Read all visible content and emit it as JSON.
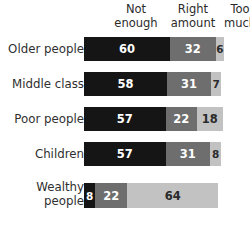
{
  "chart_data": {
    "type": "bar",
    "subtype": "horizontal-stacked-100",
    "title": "",
    "xlabel": "",
    "ylabel": "",
    "grid": false,
    "legend_position": "top",
    "categories": [
      "Older people",
      "Middle class",
      "Poor people",
      "Children",
      "Wealthy people"
    ],
    "series": [
      {
        "name": "Not enough",
        "values": [
          60,
          58,
          57,
          57,
          8
        ]
      },
      {
        "name": "Right amount",
        "values": [
          32,
          31,
          22,
          31,
          22
        ]
      },
      {
        "name": "Too much",
        "values": [
          6,
          7,
          18,
          8,
          64
        ]
      }
    ],
    "colors": {
      "not_enough": "#151515",
      "right_amount": "#6e6e6e",
      "too_much": "#c2c2c2",
      "background": "#ffffff",
      "label_text": "#2f2f2f"
    },
    "value_label_colors": [
      [
        "#ffffff",
        "#ffffff",
        "#2b2b2b"
      ],
      [
        "#ffffff",
        "#ffffff",
        "#2b2b2b"
      ],
      [
        "#ffffff",
        "#ffffff",
        "#2b2b2b"
      ],
      [
        "#ffffff",
        "#ffffff",
        "#2b2b2b"
      ],
      [
        "#ffffff",
        "#ffffff",
        "#2b2b2b"
      ]
    ]
  },
  "headers": [
    {
      "label": "Not\nenough"
    },
    {
      "label": "Right\namount"
    },
    {
      "label": "Too\nmuch"
    }
  ],
  "rows": [
    {
      "label": "Older people",
      "segments": [
        {
          "value": "60",
          "pct": 60
        },
        {
          "value": "32",
          "pct": 32
        },
        {
          "value": "6",
          "pct": 6
        }
      ]
    },
    {
      "label": "Middle class",
      "segments": [
        {
          "value": "58",
          "pct": 58
        },
        {
          "value": "31",
          "pct": 31
        },
        {
          "value": "7",
          "pct": 7
        }
      ]
    },
    {
      "label": "Poor people",
      "segments": [
        {
          "value": "57",
          "pct": 57
        },
        {
          "value": "22",
          "pct": 22
        },
        {
          "value": "18",
          "pct": 18
        }
      ]
    },
    {
      "label": "Children",
      "segments": [
        {
          "value": "57",
          "pct": 57
        },
        {
          "value": "31",
          "pct": 31
        },
        {
          "value": "8",
          "pct": 8
        }
      ]
    },
    {
      "label": "Wealthy\npeople",
      "segments": [
        {
          "value": "8",
          "pct": 8
        },
        {
          "value": "22",
          "pct": 22
        },
        {
          "value": "64",
          "pct": 64
        }
      ]
    }
  ]
}
